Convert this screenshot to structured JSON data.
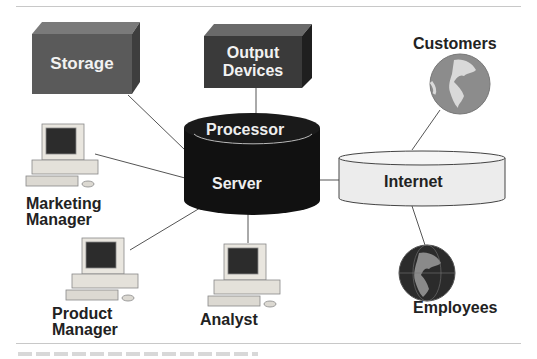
{
  "diagram": {
    "nodes": {
      "storage": {
        "label": "Storage"
      },
      "output": {
        "line1": "Output",
        "line2": "Devices"
      },
      "processor": {
        "label": "Processor"
      },
      "server": {
        "label": "Server"
      },
      "internet": {
        "label": "Internet"
      },
      "customers": {
        "label": "Customers"
      },
      "employees": {
        "label": "Employees"
      },
      "marketing": {
        "line1": "Marketing",
        "line2": "Manager"
      },
      "product": {
        "line1": "Product",
        "line2": "Manager"
      },
      "analyst": {
        "label": "Analyst"
      }
    },
    "colors": {
      "storage_box": "#5a5a5a",
      "output_box": "#3a3a3a",
      "server_cylinder": "#111111",
      "internet_cylinder": "#eeeeee",
      "globe_light": "#8c8c8c",
      "globe_dark": "#2b2b2b"
    }
  }
}
